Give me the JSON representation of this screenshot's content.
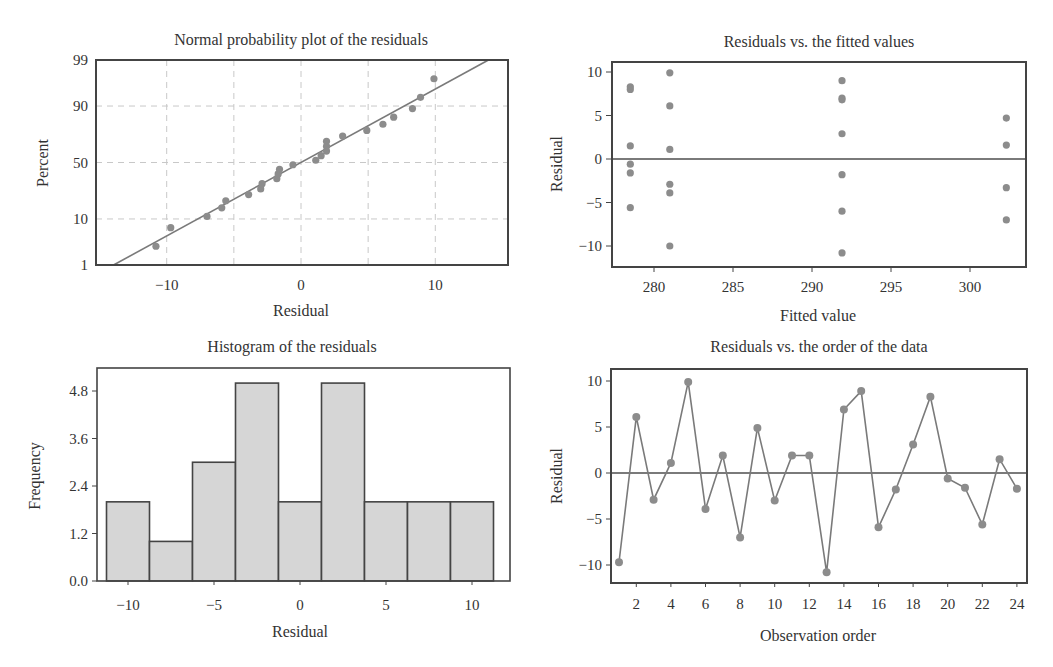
{
  "figure": {
    "panels": [
      {
        "id": "normal",
        "title": "Normal probability plot of the residuals",
        "xlabel": "Residual",
        "ylabel": "Percent"
      },
      {
        "id": "fitted",
        "title": "Residuals vs. the fitted values",
        "xlabel": "Fitted value",
        "ylabel": "Residual"
      },
      {
        "id": "hist",
        "title": "Histogram of the residuals",
        "xlabel": "Residual",
        "ylabel": "Frequency"
      },
      {
        "id": "order",
        "title": "Residuals vs. the order of the data",
        "xlabel": "Observation order",
        "ylabel": "Residual"
      }
    ],
    "colors": {
      "point": "#8c8c8c",
      "line": "#7a7a7a",
      "frame": "#444444",
      "grid": "#c8c8c8",
      "bar_fill": "#d6d6d6",
      "bar_edge": "#444444"
    }
  },
  "chart_data": [
    {
      "type": "scatter",
      "title": "Normal probability plot of the residuals",
      "xlabel": "Residual",
      "ylabel": "Percent",
      "xlim": [
        -15,
        15
      ],
      "x_ticks": [
        -10,
        0,
        10
      ],
      "y_ticks": [
        1,
        10,
        50,
        90,
        99
      ],
      "y_scale": "normal-probability",
      "grid": true,
      "fit_line": {
        "mean": 0,
        "sd": 6.0
      },
      "residuals_sorted": [
        -10.8,
        -9.7,
        -7.0,
        -5.9,
        -5.6,
        -3.9,
        -3.0,
        -2.9,
        -1.8,
        -1.7,
        -1.6,
        -0.6,
        1.1,
        1.5,
        1.9,
        1.9,
        1.9,
        3.1,
        4.9,
        6.1,
        6.9,
        8.3,
        8.9,
        9.9
      ]
    },
    {
      "type": "scatter",
      "title": "Residuals vs. the fitted values",
      "xlabel": "Fitted value",
      "ylabel": "Residual",
      "xlim": [
        277.2,
        304.2
      ],
      "ylim": [
        -12.5,
        11.5
      ],
      "x_ticks": [
        280,
        285,
        290,
        295,
        300
      ],
      "y_ticks": [
        -10,
        -5,
        0,
        5,
        10
      ],
      "reference_line": 0,
      "points": [
        {
          "x": 278.5,
          "y": 8.3
        },
        {
          "x": 278.5,
          "y": 8.0
        },
        {
          "x": 278.5,
          "y": 1.5
        },
        {
          "x": 278.5,
          "y": -0.6
        },
        {
          "x": 278.5,
          "y": -1.6
        },
        {
          "x": 278.5,
          "y": -5.6
        },
        {
          "x": 281.0,
          "y": 9.9
        },
        {
          "x": 281.0,
          "y": 6.1
        },
        {
          "x": 281.0,
          "y": 1.1
        },
        {
          "x": 281.0,
          "y": -2.9
        },
        {
          "x": 281.0,
          "y": -3.9
        },
        {
          "x": 281.0,
          "y": -10.0
        },
        {
          "x": 291.9,
          "y": 9.0
        },
        {
          "x": 291.9,
          "y": 7.0
        },
        {
          "x": 291.9,
          "y": 6.8
        },
        {
          "x": 291.9,
          "y": 2.9
        },
        {
          "x": 291.9,
          "y": -1.8
        },
        {
          "x": 291.9,
          "y": -6.0
        },
        {
          "x": 291.9,
          "y": -10.8
        },
        {
          "x": 302.3,
          "y": 4.7
        },
        {
          "x": 302.3,
          "y": 1.6
        },
        {
          "x": 302.3,
          "y": -3.3
        },
        {
          "x": 302.3,
          "y": -7.0
        }
      ]
    },
    {
      "type": "bar",
      "title": "Histogram of the residuals",
      "xlabel": "Residual",
      "ylabel": "Frequency",
      "bin_edges": [
        -11.25,
        -8.75,
        -6.25,
        -3.75,
        -1.25,
        1.25,
        3.75,
        6.25,
        8.75,
        11.25
      ],
      "values": [
        2,
        1,
        3,
        5,
        2,
        5,
        2,
        2,
        2
      ],
      "xlim": [
        -12.5,
        13.0
      ],
      "ylim": [
        0,
        5.4
      ],
      "x_ticks": [
        -10,
        -5,
        0,
        5,
        10
      ],
      "y_ticks": [
        "0.0",
        "1.2",
        "2.4",
        "3.6",
        "4.8"
      ]
    },
    {
      "type": "line",
      "title": "Residuals vs. the order of the data",
      "xlabel": "Observation order",
      "ylabel": "Residual",
      "x": [
        1,
        2,
        3,
        4,
        5,
        6,
        7,
        8,
        9,
        10,
        11,
        12,
        13,
        14,
        15,
        16,
        17,
        18,
        19,
        20,
        21,
        22,
        23,
        24
      ],
      "values": [
        -9.7,
        6.1,
        -2.9,
        1.1,
        9.9,
        -3.9,
        1.9,
        -7.0,
        4.9,
        -3.0,
        1.9,
        1.9,
        -10.8,
        6.9,
        8.9,
        -5.9,
        -1.8,
        3.1,
        8.3,
        -0.6,
        -1.6,
        -5.6,
        1.5,
        -1.7
      ],
      "ylim": [
        -12.2,
        11.5
      ],
      "x_ticks": [
        2,
        4,
        6,
        8,
        10,
        12,
        14,
        16,
        18,
        20,
        22,
        24
      ],
      "y_ticks": [
        -10,
        -5,
        0,
        5,
        10
      ],
      "reference_line": 0,
      "markers": true
    }
  ]
}
